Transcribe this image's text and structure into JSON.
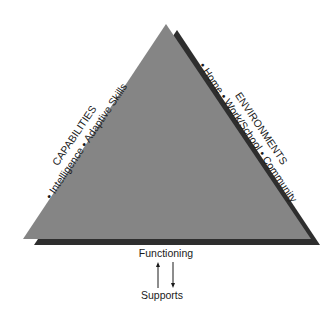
{
  "diagram": {
    "left_side": {
      "heading": "CAPABILITIES",
      "items": "• Intelligence • Adaptive Skills"
    },
    "right_side": {
      "heading": "ENVIRONMENTS",
      "items": "• Home • Work/School • Community"
    },
    "bottom": {
      "top_label": "Functioning",
      "bottom_label": "Supports"
    },
    "colors": {
      "triangle_fill": "#858585",
      "shadow_fill": "#2e2e2e",
      "text": "#1a1a1a"
    }
  }
}
